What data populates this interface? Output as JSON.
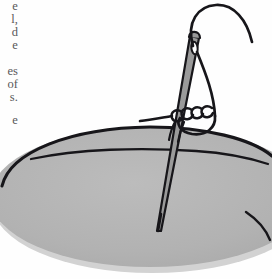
{
  "page": {
    "width": 272,
    "height": 279,
    "background_color": "#fefefe",
    "document_type": "scanned book page with illustration"
  },
  "body_text": {
    "description": "Body text clipped by the left page margin; only the final characters of each line are visible",
    "text_color": "#59585a",
    "lines": [
      {
        "text": "e",
        "top": 0
      },
      {
        "text": "l,",
        "top": 13
      },
      {
        "text": "d",
        "top": 26
      },
      {
        "text": "e",
        "top": 39
      },
      {
        "text": "es",
        "top": 65
      },
      {
        "text": "of",
        "top": 78
      },
      {
        "text": "s.",
        "top": 91
      },
      {
        "text": "e",
        "top": 114
      }
    ]
  },
  "illustration": {
    "name": "coiled-stitch-needle-diagram",
    "caption": "",
    "colors": {
      "fabric_fill": "#b2b2b2",
      "fabric_fill_light": "#bdbdbd",
      "ink": "#17161a",
      "needle_fill": "#8f8f8f",
      "shadow": "#c8c8c8"
    },
    "parts": {
      "fabric": "gray elliptical fabric hoop",
      "crease": "curved fold line across upper fabric",
      "needle": "sewing needle angled from upper right into fabric",
      "needle_eye": "elongated oval eye near needle head",
      "thread_loop": "thread arcing up from the eye and over to the right",
      "thread_coils": "four thread wraps coiled around the needle shaft",
      "thread_tail": "free thread end curving off the upper right"
    }
  }
}
